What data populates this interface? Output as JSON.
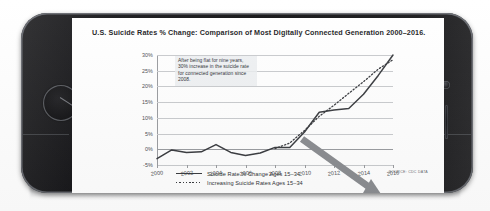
{
  "device": {
    "type": "smartphone",
    "orientation": "landscape",
    "home_button": "home-button",
    "camera": "camera-lens",
    "speaker": "earpiece-speaker"
  },
  "chart_data": {
    "type": "line",
    "title": "U.S. Suicide Rates % Change: Comparison of Most Digitally Connected Generation 2000–2016.",
    "xlabel": "",
    "ylabel": "",
    "grid": true,
    "legend_position": "bottom",
    "ylim": [
      -5,
      30
    ],
    "xlim": [
      2000,
      2016
    ],
    "ytick_labels": [
      "30%",
      "25%",
      "20%",
      "15%",
      "10%",
      "5%",
      "0%",
      "-5%"
    ],
    "ytick_values": [
      30,
      25,
      20,
      15,
      10,
      5,
      0,
      -5
    ],
    "xtick_labels": [
      "2000",
      "2002",
      "2004",
      "2006",
      "2008",
      "2010",
      "2012",
      "2014",
      "2016"
    ],
    "xtick_values": [
      2000,
      2002,
      2004,
      2006,
      2008,
      2010,
      2012,
      2014,
      2016
    ],
    "x": [
      2000,
      2001,
      2002,
      2003,
      2004,
      2005,
      2006,
      2007,
      2008,
      2009,
      2010,
      2011,
      2012,
      2013,
      2014,
      2015,
      2016
    ],
    "series": [
      {
        "name": "Suicide Rate % Change Ages 15–34",
        "style": "solid",
        "color": "#3a3c40",
        "values": [
          -3.0,
          -0.2,
          -1.0,
          -0.8,
          1.5,
          -1.0,
          -2.0,
          -1.2,
          0.6,
          0.6,
          5.5,
          11.8,
          12.5,
          13.0,
          17.5,
          23.5,
          30.0
        ]
      },
      {
        "name": "Increasing Suicide Rates Ages 15–34",
        "style": "dotted",
        "color": "#3a3c40",
        "values": [
          null,
          null,
          null,
          null,
          null,
          null,
          null,
          null,
          0.2,
          2.0,
          6.0,
          10.5,
          14.0,
          17.8,
          21.5,
          25.5,
          28.5
        ]
      }
    ],
    "annotations": [
      {
        "name": "flat-then-rise-callout",
        "text": "After being flat for nine years, 30% increase in the suicide rate for connected generation since 2008."
      },
      {
        "name": "downward-trend-arrow",
        "type": "arrow",
        "color": "#8b8d91"
      }
    ],
    "source": "SOURCE: CDC DATA"
  }
}
